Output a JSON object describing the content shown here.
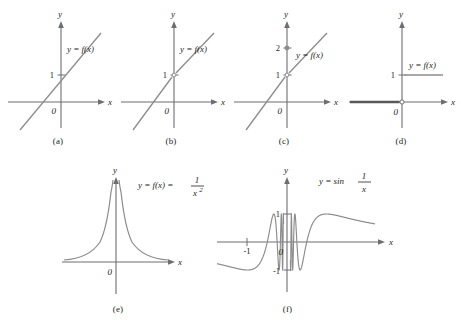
{
  "figure": {
    "type": "math-figure",
    "background": "#ffffff",
    "curve_color": "#8c8c8c",
    "axis_color": "#6d6e71",
    "text_color": "#231f20"
  },
  "panels": [
    {
      "id": "a",
      "caption": "(a)",
      "equation": "y = f(x)",
      "x_axis_label": "x",
      "y_axis_label": "y",
      "origin_label": "0",
      "y_ticks": [
        "1"
      ],
      "x_ticks": [],
      "graph_type": "line",
      "continuous": true,
      "marks": []
    },
    {
      "id": "b",
      "caption": "(b)",
      "equation": "y = f(x)",
      "x_axis_label": "x",
      "y_axis_label": "y",
      "origin_label": "0",
      "y_ticks": [
        "1"
      ],
      "x_ticks": [],
      "graph_type": "line",
      "continuous": false,
      "marks": [
        "open-circle-at-y-1"
      ]
    },
    {
      "id": "c",
      "caption": "(c)",
      "equation": "y = f(x)",
      "x_axis_label": "x",
      "y_axis_label": "y",
      "origin_label": "0",
      "y_ticks": [
        "2",
        "1"
      ],
      "x_ticks": [],
      "graph_type": "line",
      "continuous": false,
      "marks": [
        "filled-dot-at-y-2",
        "open-circle-at-y-1"
      ]
    },
    {
      "id": "d",
      "caption": "(d)",
      "equation": "y = f(x)",
      "x_axis_label": "x",
      "y_axis_label": "y",
      "origin_label": "0",
      "y_ticks": [
        "1"
      ],
      "x_ticks": [],
      "graph_type": "step",
      "continuous": false,
      "marks": [
        "open-circle-at-origin"
      ]
    },
    {
      "id": "e",
      "caption": "(e)",
      "equation_prefix": "y = f(x) = ",
      "equation_numerator": "1",
      "equation_denominator": "x",
      "equation_exponent": "2",
      "x_axis_label": "x",
      "y_axis_label": "y",
      "origin_label": "0",
      "y_ticks": [],
      "x_ticks": [],
      "graph_type": "reciprocal-square",
      "continuous": false,
      "marks": [
        "vertical-asymptote-at-0"
      ]
    },
    {
      "id": "f",
      "caption": "(f)",
      "equation_prefix": "y = sin ",
      "equation_numerator": "1",
      "equation_denominator": "x",
      "x_axis_label": "x",
      "y_axis_label": "y",
      "origin_label": "0",
      "y_ticks": [
        "1",
        "-1"
      ],
      "x_ticks": [
        "-1"
      ],
      "graph_type": "sine-reciprocal",
      "continuous": false,
      "marks": [
        "oscillation-near-zero"
      ]
    }
  ],
  "chart_data": {
    "type": "line",
    "title": "",
    "panels": [
      {
        "id": "a",
        "function": "linear",
        "expression": "y = f(x)",
        "slope": 1.35,
        "y_intercept": 1,
        "xlim": [
          -2.6,
          2.0
        ],
        "ylim": [
          -2.4,
          2.6
        ],
        "grid": false,
        "continuous": true
      },
      {
        "id": "b",
        "function": "linear-with-removable-discontinuity",
        "expression": "y = f(x)",
        "slope": 1.35,
        "y_intercept": 1,
        "hole_at": [
          0,
          1
        ],
        "xlim": [
          -2.6,
          2.0
        ],
        "ylim": [
          -2.4,
          2.6
        ],
        "grid": false,
        "continuous": false
      },
      {
        "id": "c",
        "function": "linear-with-redefined-point",
        "expression": "y = f(x)",
        "slope": 1.35,
        "y_intercept": 1,
        "hole_at": [
          0,
          1
        ],
        "point_at": [
          0,
          2
        ],
        "xlim": [
          -2.6,
          2.0
        ],
        "ylim": [
          -2.4,
          2.6
        ],
        "grid": false,
        "continuous": false
      },
      {
        "id": "d",
        "function": "step",
        "expression": "y = f(x)",
        "left_value": 0,
        "right_value": 1,
        "jump_at": 0,
        "xlim": [
          -2.6,
          2.0
        ],
        "ylim": [
          -2.4,
          2.6
        ],
        "grid": false,
        "continuous": false
      },
      {
        "id": "e",
        "function": "1/x^2",
        "expression": "y = f(x) = 1/x^2",
        "asymptote_x": 0,
        "xlim": [
          -2.6,
          2.6
        ],
        "ylim": [
          -0.6,
          3.2
        ],
        "grid": false,
        "continuous": false
      },
      {
        "id": "f",
        "function": "sin(1/x)",
        "expression": "y = sin 1/x",
        "amplitude": 1,
        "xlim": [
          -1.45,
          1.45
        ],
        "ylim": [
          -1.35,
          1.35
        ],
        "grid": false,
        "continuous": false
      }
    ]
  }
}
